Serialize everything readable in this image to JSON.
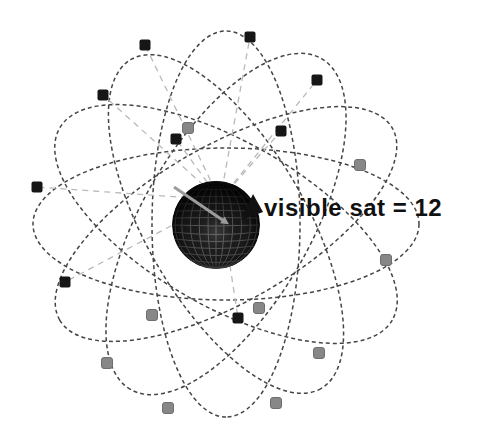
{
  "figure": {
    "annotation": {
      "label": "visible sat = 12",
      "visible_sat_count": 12
    },
    "colors": {
      "background": "#ffffff",
      "orbit_line": "#454545",
      "sight_line": "#b9b9b9",
      "satellite_visible": "#161616",
      "satellite_hidden": "#878787",
      "satellite_hidden_border": "#6e6e6e",
      "earth_base": "#131313",
      "earth_grid": "#5d5d5d",
      "observer_arrow": "#9c9c9c",
      "label_text": "#111111"
    },
    "earth": {
      "cx": 216,
      "cy": 225,
      "r": 44
    },
    "orbits": {
      "cx": 226,
      "cy": 224,
      "ellipses": [
        {
          "rx": 193,
          "ry": 76,
          "rot": 0
        },
        {
          "rx": 192,
          "ry": 82,
          "rot": 30
        },
        {
          "rx": 190,
          "ry": 80,
          "rot": 60
        },
        {
          "rx": 193,
          "ry": 74,
          "rot": 90
        },
        {
          "rx": 191,
          "ry": 84,
          "rot": 120
        },
        {
          "rx": 192,
          "ry": 78,
          "rot": 150
        }
      ]
    },
    "satellites": {
      "visible": [
        [
          145,
          45
        ],
        [
          250,
          37
        ],
        [
          103,
          95
        ],
        [
          317,
          80
        ],
        [
          176,
          139
        ],
        [
          281,
          131
        ],
        [
          37,
          187
        ],
        [
          65,
          282
        ],
        [
          238,
          318
        ]
      ],
      "hidden": [
        [
          188,
          128
        ],
        [
          360,
          165
        ],
        [
          386,
          260
        ],
        [
          259,
          308
        ],
        [
          152,
          315
        ],
        [
          319,
          353
        ],
        [
          107,
          363
        ],
        [
          168,
          408
        ],
        [
          276,
          403
        ]
      ]
    },
    "sight_origin": [
      220,
      200
    ],
    "observer_arrow": {
      "from": [
        174,
        187
      ],
      "to": [
        224,
        221
      ]
    },
    "label_pointer": [
      [
        241,
        220
      ],
      [
        253,
        194
      ],
      [
        263,
        212
      ]
    ],
    "label_pos": {
      "x": 264,
      "y": 216
    },
    "marker_size": 11
  }
}
